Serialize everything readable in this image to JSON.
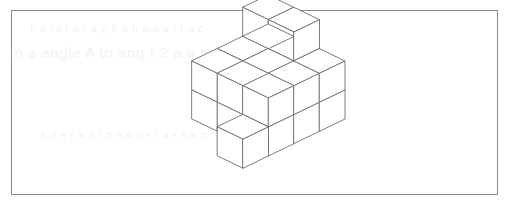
{
  "page": {
    "background_color": "#ffffff",
    "width": 510,
    "height": 213
  },
  "frame": {
    "name": "figure-frame",
    "border_color": "#8b8b8b",
    "border_width": 1,
    "left": 11,
    "top": 10,
    "width": 487,
    "height": 185
  },
  "ghost_text": {
    "color": "#f2f2f2",
    "line_1": "n a angle A  to  ang t 2  a  a mer  te li   hae  ca  b",
    "line_2": "b   o  ra t  o  r a  g  b   s   n    a  o   s  t  r a  o",
    "line_3": "s  o e r   a  n t  e   s o   o r  t    a  r  s  a   e"
  },
  "figure": {
    "name": "isometric-cube-block-diagram",
    "stroke_color": "#6e6e6e",
    "stroke_width": 0.9,
    "face_fill": "#ffffff",
    "shaded_fill": "#a0a0a0",
    "shaded_fill_dark": "#8e8e8e",
    "origin_x": 192,
    "origin_y": 119,
    "unit_x_dx": 25.5,
    "unit_x_dy": 12.3,
    "unit_y_dx": 25.5,
    "unit_y_dy": -12.3,
    "unit_z": 29.0,
    "bounds": {
      "left": 192,
      "right": 312,
      "top": 31,
      "bottom": 182
    },
    "cube_count_visible": 24,
    "shaded_faces": 2
  }
}
